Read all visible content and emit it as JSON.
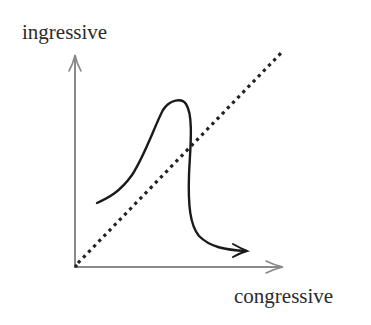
{
  "diagram": {
    "y_axis": {
      "label": "ingressive",
      "color": "#8a8a8a"
    },
    "x_axis": {
      "label": "congressive",
      "color": "#8a8a8a"
    },
    "reference_line": {
      "style": "dotted",
      "description": "diagonal identity line y = x",
      "color": "#222222"
    },
    "curve": {
      "style": "solid",
      "description": "rises to a peak above the diagonal, then falls steeply below it ending in an arrow pointing right",
      "color": "#1a1a1a"
    }
  }
}
